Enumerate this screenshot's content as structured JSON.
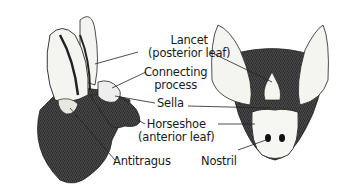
{
  "figure": {
    "labels": {
      "lancet_line1": "Lancet",
      "lancet_line2": "(posterior leaf)",
      "connecting_line1": "Connecting",
      "connecting_line2": "process",
      "sella": "Sella",
      "horseshoe_line1": "Horseshoe",
      "horseshoe_line2": "(anterior leaf)",
      "antitragus": "Antitragus",
      "nostril": "Nostril"
    }
  }
}
